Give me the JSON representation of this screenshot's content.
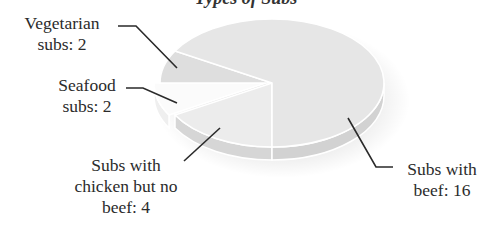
{
  "chart_data": {
    "type": "pie",
    "style": "3d",
    "title": "Types of Subs",
    "title_partially_visible": true,
    "total": 24,
    "slices": [
      {
        "label": "Subs with beef",
        "value": 16,
        "display": "Subs with\nbeef: 16",
        "color": "#e6e6e6",
        "side_color": "#d2d2d2"
      },
      {
        "label": "Subs with chicken but no beef",
        "value": 4,
        "display": "Subs with\nchicken but no\nbeef: 4",
        "color": "#ececec",
        "side_color": "#d6d6d6"
      },
      {
        "label": "Seafood subs",
        "value": 2,
        "display": "Seafood\nsubs: 2",
        "color": "#fbfbfb",
        "side_color": "#efefef"
      },
      {
        "label": "Vegetarian subs",
        "value": 2,
        "display": "Vegetarian\nsubs: 2",
        "color": "#dedede",
        "side_color": "#cccccc"
      }
    ],
    "legend": "none",
    "grid": false
  },
  "labels": {
    "title": "Types of Subs",
    "vegetarian": "Vegetarian\nsubs: 2",
    "seafood": "Seafood\nsubs: 2",
    "chicken": "Subs with\nchicken but no\nbeef: 4",
    "beef": "Subs with\nbeef: 16"
  },
  "colors": {
    "leader_line": "#2a2a2a",
    "slice_edge": "#ffffff"
  }
}
